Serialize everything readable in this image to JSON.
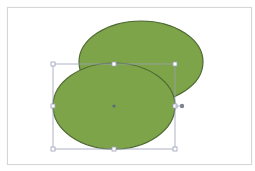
{
  "canvas": {
    "background": "#ffffff",
    "slide_border": "#d6d6d6"
  },
  "shapes": [
    {
      "name": "back-ellipse",
      "type": "ellipse",
      "cx": 141,
      "cy": 62,
      "rx": 62,
      "ry": 41,
      "fill": "#7ea44a",
      "stroke": "#4f6b34"
    },
    {
      "name": "front-ellipse",
      "type": "ellipse",
      "cx": 114,
      "cy": 106,
      "rx": 61,
      "ry": 43,
      "fill": "#7ea44a",
      "stroke": "#4f6b34",
      "selected": true
    }
  ],
  "selection": {
    "box": {
      "x": 53,
      "y": 64,
      "w": 122,
      "h": 85
    },
    "handle_color": "#9aa0b4",
    "rotation_handle": {
      "x": 182,
      "y": 106
    }
  }
}
